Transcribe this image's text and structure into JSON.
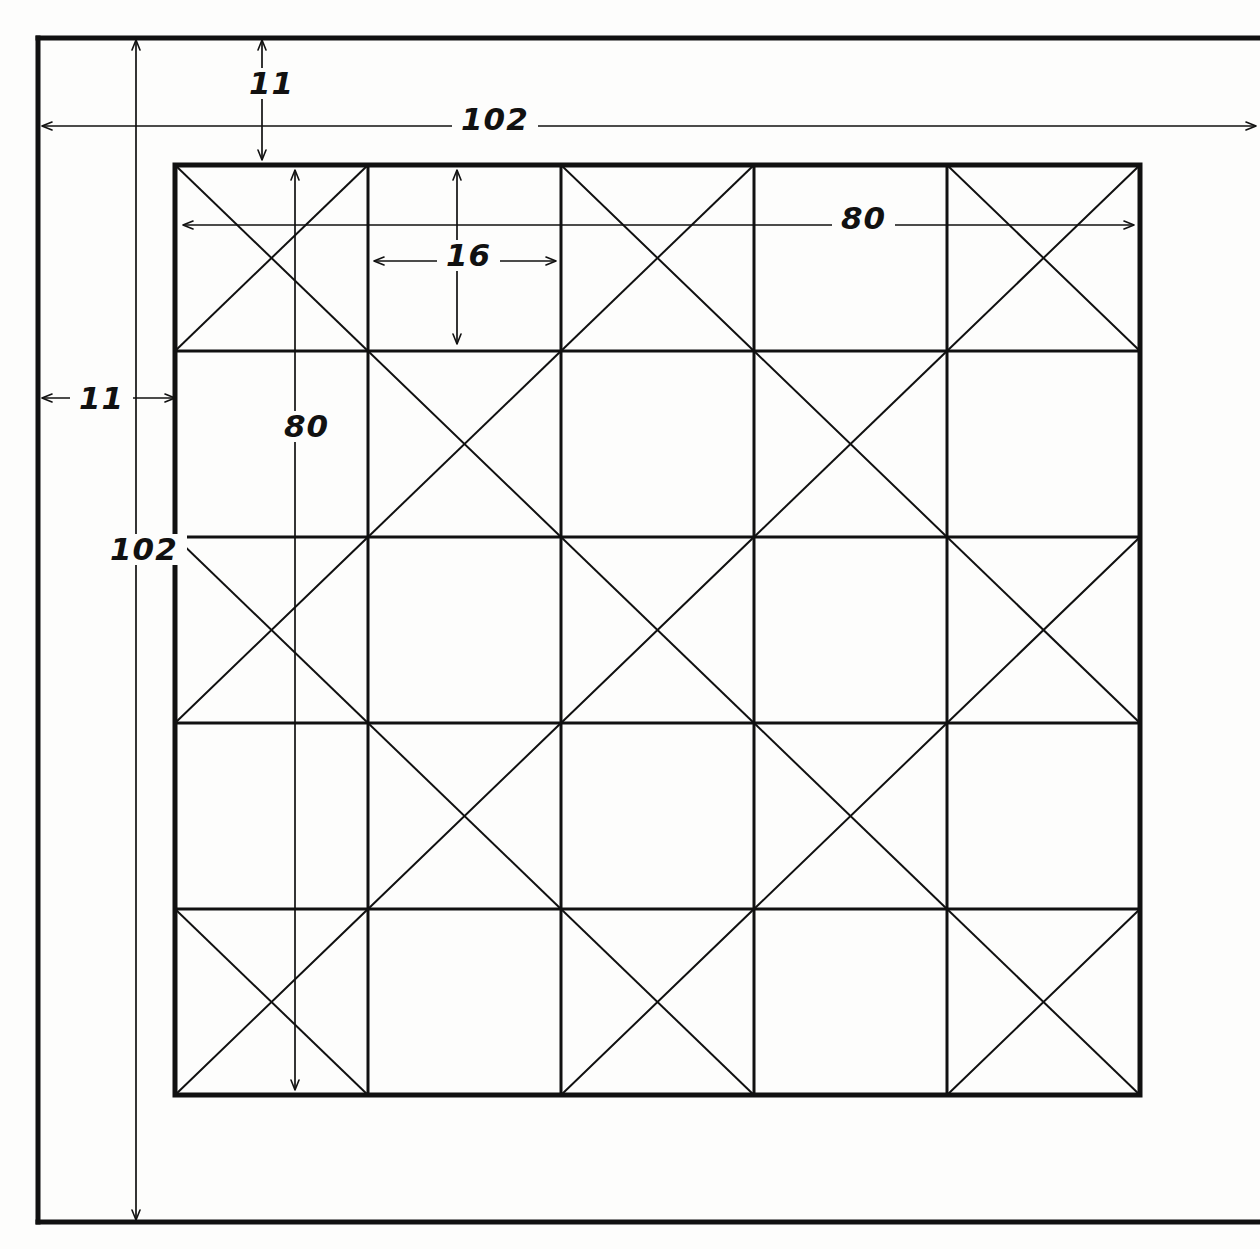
{
  "drawing": {
    "title": "Hand-drawn dimensioned grid panel",
    "background_color": "#fdfdfc",
    "ink_color": "#111111",
    "sheet": {
      "width": 1260,
      "height": 1249
    },
    "outer_frame": {
      "x": 36,
      "y": 36,
      "width": 1186,
      "height": 1186,
      "stroke_width": 5
    },
    "grid": {
      "x": 175,
      "y": 165,
      "width": 965,
      "height": 930,
      "rows": 5,
      "cols": 5,
      "outer_stroke_width": 5,
      "inner_stroke_width": 3,
      "diagonal_stroke_width": 2,
      "diagonal_pattern": [
        [
          true,
          false,
          true,
          false,
          true
        ],
        [
          false,
          true,
          false,
          true,
          false
        ],
        [
          true,
          false,
          true,
          false,
          true
        ],
        [
          false,
          true,
          false,
          true,
          false
        ],
        [
          true,
          false,
          true,
          false,
          true
        ]
      ]
    },
    "dimensions": [
      {
        "id": "overall-width",
        "value": "102",
        "orientation": "horizontal",
        "from": 42,
        "to": 1256,
        "axis": 126,
        "arrows": "both"
      },
      {
        "id": "overall-height",
        "value": "102",
        "orientation": "vertical",
        "from": 40,
        "to": 1220,
        "axis": 136,
        "arrows": "both"
      },
      {
        "id": "top-margin",
        "value": "11",
        "orientation": "vertical",
        "from": 40,
        "to": 160,
        "axis": 262,
        "arrows": "both"
      },
      {
        "id": "left-margin",
        "value": "11",
        "orientation": "horizontal",
        "from": 42,
        "to": 175,
        "axis": 398,
        "arrows": "both"
      },
      {
        "id": "grid-width",
        "value": "80",
        "orientation": "horizontal",
        "from": 183,
        "to": 1134,
        "axis": 225,
        "arrows": "both"
      },
      {
        "id": "grid-height",
        "value": "80",
        "orientation": "vertical",
        "from": 170,
        "to": 1090,
        "axis": 295,
        "arrows": "both"
      },
      {
        "id": "cell-width",
        "value": "16",
        "orientation": "horizontal",
        "from": 374,
        "to": 556,
        "axis": 261,
        "arrows": "both"
      },
      {
        "id": "cell-height",
        "value": "16",
        "orientation": "vertical",
        "from": 170,
        "to": 344,
        "axis": 457,
        "arrows": "both"
      }
    ]
  }
}
